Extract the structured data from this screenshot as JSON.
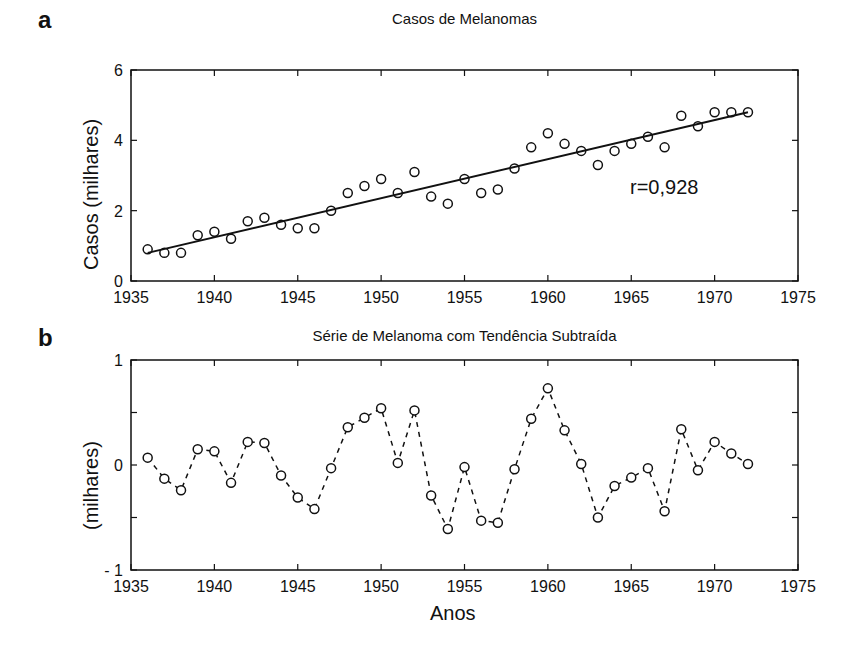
{
  "chart_data": [
    {
      "panel": "a",
      "type": "scatter",
      "title": "Casos de Melanomas",
      "xlabel": "",
      "ylabel": "Casos (milhares)",
      "xlim": [
        1935,
        1975
      ],
      "ylim": [
        0,
        6
      ],
      "xticks": [
        "1935",
        "1940",
        "1945",
        "1950",
        "1955",
        "1960",
        "1965",
        "1970",
        "1975"
      ],
      "yticks": [
        "0",
        "2",
        "4",
        "6"
      ],
      "annotation": "r=0,928",
      "x": [
        1936,
        1937,
        1938,
        1939,
        1940,
        1941,
        1942,
        1943,
        1944,
        1945,
        1946,
        1947,
        1948,
        1949,
        1950,
        1951,
        1952,
        1953,
        1954,
        1955,
        1956,
        1957,
        1958,
        1959,
        1960,
        1961,
        1962,
        1963,
        1964,
        1965,
        1966,
        1967,
        1968,
        1969,
        1970,
        1971,
        1972
      ],
      "series": [
        {
          "name": "Casos",
          "marker": "open-circle",
          "values": [
            0.9,
            0.8,
            0.8,
            1.3,
            1.4,
            1.2,
            1.7,
            1.8,
            1.6,
            1.5,
            1.5,
            2.0,
            2.5,
            2.7,
            2.9,
            2.5,
            3.1,
            2.4,
            2.2,
            2.9,
            2.5,
            2.6,
            3.2,
            3.8,
            4.2,
            3.9,
            3.7,
            3.3,
            3.7,
            3.9,
            4.1,
            3.8,
            4.7,
            4.4,
            4.8,
            4.8,
            4.8
          ]
        },
        {
          "name": "Tendência linear",
          "line": "solid",
          "x": [
            1936,
            1972
          ],
          "values": [
            0.8,
            4.8
          ]
        }
      ],
      "grid": false
    },
    {
      "panel": "b",
      "type": "line",
      "title": "Série de Melanoma com Tendência Subtraída",
      "xlabel": "Anos",
      "ylabel": "(milhares)",
      "xlim": [
        1935,
        1975
      ],
      "ylim": [
        -1,
        1
      ],
      "xticks": [
        "1935",
        "1940",
        "1945",
        "1950",
        "1955",
        "1960",
        "1965",
        "1970",
        "1975"
      ],
      "yticks": [
        "- 1",
        "0",
        "1"
      ],
      "x": [
        1936,
        1937,
        1938,
        1939,
        1940,
        1941,
        1942,
        1943,
        1944,
        1945,
        1946,
        1947,
        1948,
        1949,
        1950,
        1951,
        1952,
        1953,
        1954,
        1955,
        1956,
        1957,
        1958,
        1959,
        1960,
        1961,
        1962,
        1963,
        1964,
        1965,
        1966,
        1967,
        1968,
        1969,
        1970,
        1971,
        1972
      ],
      "series": [
        {
          "name": "Resíduo",
          "marker": "open-circle",
          "line": "dashed",
          "values": [
            0.07,
            -0.13,
            -0.24,
            0.15,
            0.13,
            -0.17,
            0.22,
            0.21,
            -0.1,
            -0.31,
            -0.42,
            -0.03,
            0.36,
            0.45,
            0.54,
            0.02,
            0.52,
            -0.29,
            -0.61,
            -0.02,
            -0.53,
            -0.55,
            -0.04,
            0.44,
            0.73,
            0.33,
            0.01,
            -0.5,
            -0.2,
            -0.12,
            -0.03,
            -0.44,
            0.34,
            -0.05,
            0.22,
            0.11,
            0.01
          ]
        }
      ],
      "grid": false
    }
  ],
  "labels": {
    "a": "a",
    "b": "b"
  }
}
